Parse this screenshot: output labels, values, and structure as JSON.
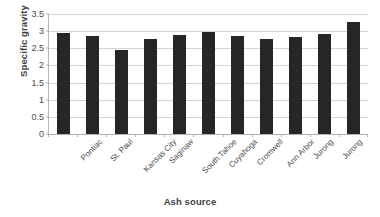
{
  "chart_data": {
    "type": "bar",
    "title": "",
    "xlabel": "Ash source",
    "ylabel": "Specific gravity",
    "categories": [
      "Pontiac",
      "St. Paul",
      "Kansas City",
      "Saginaw",
      "South Tahoe",
      "Cuyahoga",
      "Cromwell",
      "Ann Arbor",
      "Jurong",
      "Jurong",
      "Industrial Sludge"
    ],
    "values": [
      2.95,
      2.86,
      2.46,
      2.78,
      2.88,
      2.97,
      2.87,
      2.76,
      2.83,
      2.92,
      3.27
    ],
    "ylim": [
      0,
      3.5
    ],
    "ytick_labels": [
      "0",
      "0.5",
      "1",
      "1.5",
      "2",
      "2.5",
      "3",
      "3.5"
    ],
    "ytick_values": [
      0,
      0.5,
      1,
      1.5,
      2,
      2.5,
      3,
      3.5
    ],
    "grid": true,
    "legend": false,
    "bar_color": "#262626",
    "gridline_color": "#d4d4d4",
    "axis_color": "#b0b0b0",
    "text_color": "#4a4a4a",
    "background": "#ffffff"
  }
}
